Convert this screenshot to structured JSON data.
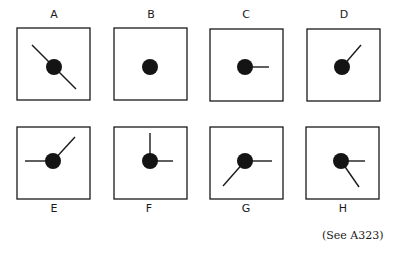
{
  "figure": {
    "panels": [
      {
        "label": "A",
        "hands": [
          [
            -22,
            -22
          ],
          [
            22,
            22
          ]
        ]
      },
      {
        "label": "B",
        "hands": []
      },
      {
        "label": "C",
        "hands": [
          [
            24,
            0
          ]
        ]
      },
      {
        "label": "D",
        "hands": [
          [
            19,
            -22
          ]
        ]
      },
      {
        "label": "E",
        "hands": [
          [
            -28,
            0
          ],
          [
            22,
            -24
          ]
        ]
      },
      {
        "label": "F",
        "hands": [
          [
            0,
            -28
          ],
          [
            23,
            0
          ]
        ]
      },
      {
        "label": "G",
        "hands": [
          [
            27,
            0
          ],
          [
            -22,
            25
          ]
        ]
      },
      {
        "label": "H",
        "hands": [
          [
            24,
            0
          ],
          [
            18,
            26
          ]
        ]
      }
    ],
    "caption": "(See A323)"
  },
  "colors": {
    "stroke": "#1a1a1a",
    "dot": "#141414",
    "background": "#ffffff"
  }
}
